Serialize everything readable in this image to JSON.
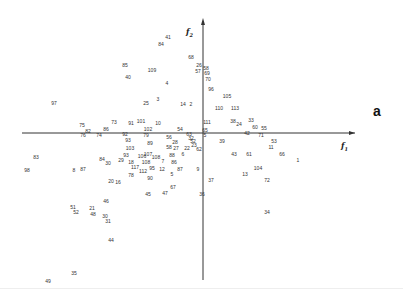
{
  "panel_label": "a",
  "chart_data": {
    "type": "scatter",
    "title": "",
    "xlabel": "f1",
    "ylabel": "f2",
    "axes": {
      "origin_px": [
        203,
        133
      ],
      "x_axis_px": [
        22,
        355
      ],
      "y_axis_px": [
        20,
        280
      ]
    },
    "grid": false,
    "legend": null,
    "points": [
      {
        "label": "41",
        "x": 168,
        "y": 37
      },
      {
        "label": "84",
        "x": 161,
        "y": 44
      },
      {
        "label": "68",
        "x": 191,
        "y": 57
      },
      {
        "label": "26",
        "x": 199,
        "y": 65
      },
      {
        "label": "58",
        "x": 206,
        "y": 68
      },
      {
        "label": "57",
        "x": 198,
        "y": 71
      },
      {
        "label": "69",
        "x": 207,
        "y": 73
      },
      {
        "label": "70",
        "x": 208,
        "y": 79
      },
      {
        "label": "85",
        "x": 125,
        "y": 65
      },
      {
        "label": "109",
        "x": 152,
        "y": 70
      },
      {
        "label": "40",
        "x": 128,
        "y": 77
      },
      {
        "label": "4",
        "x": 167,
        "y": 83
      },
      {
        "label": "96",
        "x": 211,
        "y": 89
      },
      {
        "label": "105",
        "x": 227,
        "y": 96
      },
      {
        "label": "25",
        "x": 146,
        "y": 103
      },
      {
        "label": "3",
        "x": 158,
        "y": 99
      },
      {
        "label": "14",
        "x": 183,
        "y": 104
      },
      {
        "label": "2",
        "x": 191,
        "y": 104
      },
      {
        "label": "110",
        "x": 219,
        "y": 108
      },
      {
        "label": "113",
        "x": 235,
        "y": 108
      },
      {
        "label": "97",
        "x": 54,
        "y": 103
      },
      {
        "label": "75",
        "x": 82,
        "y": 125
      },
      {
        "label": "73",
        "x": 114,
        "y": 122
      },
      {
        "label": "91",
        "x": 131,
        "y": 123
      },
      {
        "label": "101",
        "x": 141,
        "y": 121
      },
      {
        "label": "10",
        "x": 158,
        "y": 123
      },
      {
        "label": "111",
        "x": 207,
        "y": 122
      },
      {
        "label": "38",
        "x": 233,
        "y": 121
      },
      {
        "label": "24",
        "x": 239,
        "y": 124
      },
      {
        "label": "33",
        "x": 251,
        "y": 120
      },
      {
        "label": "60",
        "x": 255,
        "y": 127
      },
      {
        "label": "55",
        "x": 264,
        "y": 128
      },
      {
        "label": "82",
        "x": 88,
        "y": 131
      },
      {
        "label": "86",
        "x": 106,
        "y": 129
      },
      {
        "label": "102",
        "x": 148,
        "y": 129
      },
      {
        "label": "54",
        "x": 180,
        "y": 129
      },
      {
        "label": "65",
        "x": 205,
        "y": 130
      },
      {
        "label": "76",
        "x": 83,
        "y": 135
      },
      {
        "label": "74",
        "x": 99,
        "y": 135
      },
      {
        "label": "92",
        "x": 125,
        "y": 134
      },
      {
        "label": "79",
        "x": 146,
        "y": 135
      },
      {
        "label": "56",
        "x": 169,
        "y": 137
      },
      {
        "label": "63",
        "x": 189,
        "y": 134
      },
      {
        "label": "5",
        "x": 205,
        "y": 135
      },
      {
        "label": "42",
        "x": 247,
        "y": 133
      },
      {
        "label": "71",
        "x": 261,
        "y": 135
      },
      {
        "label": "32",
        "x": 191,
        "y": 138
      },
      {
        "label": "93",
        "x": 128,
        "y": 140
      },
      {
        "label": "28",
        "x": 175,
        "y": 142
      },
      {
        "label": "52",
        "x": 193,
        "y": 141
      },
      {
        "label": "39",
        "x": 222,
        "y": 141
      },
      {
        "label": "53",
        "x": 274,
        "y": 141
      },
      {
        "label": "89",
        "x": 150,
        "y": 143
      },
      {
        "label": "103",
        "x": 130,
        "y": 148
      },
      {
        "label": "58",
        "x": 169,
        "y": 147
      },
      {
        "label": "27",
        "x": 176,
        "y": 148
      },
      {
        "label": "22",
        "x": 187,
        "y": 148
      },
      {
        "label": "23",
        "x": 194,
        "y": 145
      },
      {
        "label": "62",
        "x": 199,
        "y": 149
      },
      {
        "label": "11",
        "x": 271,
        "y": 147
      },
      {
        "label": "66",
        "x": 282,
        "y": 154
      },
      {
        "label": "1",
        "x": 298,
        "y": 160
      },
      {
        "label": "43",
        "x": 234,
        "y": 154
      },
      {
        "label": "61",
        "x": 249,
        "y": 154
      },
      {
        "label": "88",
        "x": 172,
        "y": 155
      },
      {
        "label": "6",
        "x": 183,
        "y": 154
      },
      {
        "label": "93",
        "x": 126,
        "y": 155
      },
      {
        "label": "106",
        "x": 142,
        "y": 156
      },
      {
        "label": "107",
        "x": 148,
        "y": 154
      },
      {
        "label": "108",
        "x": 156,
        "y": 157
      },
      {
        "label": "83",
        "x": 36,
        "y": 157
      },
      {
        "label": "84",
        "x": 102,
        "y": 159
      },
      {
        "label": "30",
        "x": 108,
        "y": 163
      },
      {
        "label": "29",
        "x": 121,
        "y": 160
      },
      {
        "label": "18",
        "x": 131,
        "y": 162
      },
      {
        "label": "108",
        "x": 146,
        "y": 162
      },
      {
        "label": "7",
        "x": 163,
        "y": 161
      },
      {
        "label": "86",
        "x": 174,
        "y": 162
      },
      {
        "label": "104",
        "x": 258,
        "y": 168
      },
      {
        "label": "98",
        "x": 27,
        "y": 170
      },
      {
        "label": "8",
        "x": 74,
        "y": 170
      },
      {
        "label": "87",
        "x": 83,
        "y": 169
      },
      {
        "label": "117",
        "x": 135,
        "y": 167
      },
      {
        "label": "95",
        "x": 152,
        "y": 168
      },
      {
        "label": "12",
        "x": 162,
        "y": 169
      },
      {
        "label": "87",
        "x": 180,
        "y": 169
      },
      {
        "label": "9",
        "x": 198,
        "y": 169
      },
      {
        "label": "112",
        "x": 143,
        "y": 171
      },
      {
        "label": "5",
        "x": 172,
        "y": 174
      },
      {
        "label": "13",
        "x": 245,
        "y": 174
      },
      {
        "label": "90",
        "x": 150,
        "y": 178
      },
      {
        "label": "78",
        "x": 131,
        "y": 175
      },
      {
        "label": "37",
        "x": 211,
        "y": 180
      },
      {
        "label": "72",
        "x": 267,
        "y": 180
      },
      {
        "label": "20",
        "x": 111,
        "y": 181
      },
      {
        "label": "16",
        "x": 118,
        "y": 182
      },
      {
        "label": "67",
        "x": 173,
        "y": 187
      },
      {
        "label": "45",
        "x": 148,
        "y": 194
      },
      {
        "label": "47",
        "x": 165,
        "y": 193
      },
      {
        "label": "36",
        "x": 202,
        "y": 194
      },
      {
        "label": "46",
        "x": 106,
        "y": 201
      },
      {
        "label": "51",
        "x": 73,
        "y": 207
      },
      {
        "label": "21",
        "x": 92,
        "y": 208
      },
      {
        "label": "52",
        "x": 76,
        "y": 212
      },
      {
        "label": "48",
        "x": 93,
        "y": 214
      },
      {
        "label": "30",
        "x": 105,
        "y": 216
      },
      {
        "label": "31",
        "x": 108,
        "y": 221
      },
      {
        "label": "34",
        "x": 267,
        "y": 212
      },
      {
        "label": "44",
        "x": 111,
        "y": 240
      },
      {
        "label": "35",
        "x": 74,
        "y": 273
      },
      {
        "label": "49",
        "x": 48,
        "y": 281
      }
    ]
  }
}
